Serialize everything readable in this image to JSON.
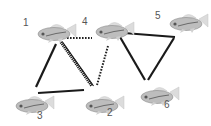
{
  "diagram": {
    "type": "fish-social-network",
    "nodes": [
      {
        "id": "1",
        "label": "1",
        "fish": {
          "x": 36,
          "y": 24
        },
        "label_pos": {
          "x": 23,
          "y": 18
        }
      },
      {
        "id": "2",
        "label": "2",
        "fish": {
          "x": 84,
          "y": 96
        },
        "label_pos": {
          "x": 107,
          "y": 108
        }
      },
      {
        "id": "3",
        "label": "3",
        "fish": {
          "x": 14,
          "y": 96
        },
        "label_pos": {
          "x": 37,
          "y": 111
        }
      },
      {
        "id": "4",
        "label": "4",
        "fish": {
          "x": 94,
          "y": 22
        },
        "label_pos": {
          "x": 82,
          "y": 17
        }
      },
      {
        "id": "5",
        "label": "5",
        "fish": {
          "x": 168,
          "y": 14
        },
        "label_pos": {
          "x": 155,
          "y": 11
        }
      },
      {
        "id": "6",
        "label": "6",
        "fish": {
          "x": 139,
          "y": 87
        },
        "label_pos": {
          "x": 164,
          "y": 100
        }
      }
    ],
    "edges": [
      {
        "from": "1",
        "to": "3",
        "style": "solid",
        "x1": 56,
        "y1": 44,
        "x2": 36,
        "y2": 87
      },
      {
        "from": "3",
        "to": "2",
        "style": "solid",
        "x1": 38,
        "y1": 93,
        "x2": 84,
        "y2": 90
      },
      {
        "from": "1",
        "to": "2",
        "style": "hatched",
        "x1": 61,
        "y1": 42,
        "x2": 92,
        "y2": 86
      },
      {
        "from": "1",
        "to": "4",
        "style": "dotted",
        "x1": 67,
        "y1": 38,
        "x2": 92,
        "y2": 38
      },
      {
        "from": "4",
        "to": "2",
        "style": "dotted",
        "x1": 108,
        "y1": 46,
        "x2": 97,
        "y2": 85
      },
      {
        "from": "4",
        "to": "5",
        "style": "solid",
        "x1": 124,
        "y1": 33,
        "x2": 175,
        "y2": 37
      },
      {
        "from": "4",
        "to": "6",
        "style": "solid",
        "x1": 120,
        "y1": 37,
        "x2": 145,
        "y2": 80
      },
      {
        "from": "5",
        "to": "6",
        "style": "solid",
        "x1": 174,
        "y1": 38,
        "x2": 148,
        "y2": 80
      }
    ],
    "colors": {
      "solid_line": "#1a1a1a",
      "dotted_line": "#222222",
      "label": "#555555",
      "fish_body": "#b8b8b8",
      "fish_fin": "#dcdcdc",
      "fish_stripe": "#6a6a6a"
    }
  }
}
